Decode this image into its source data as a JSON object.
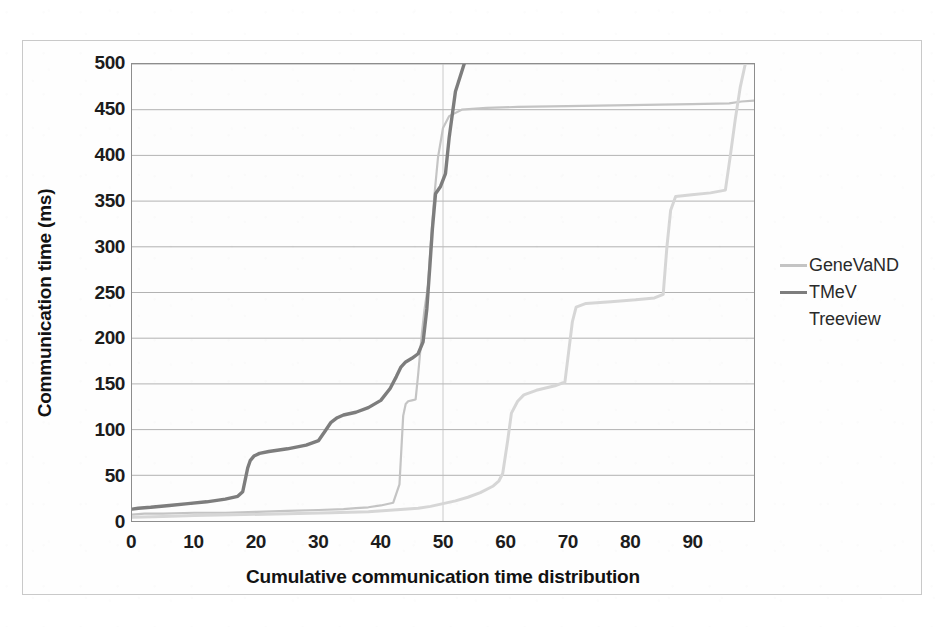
{
  "chart_data": {
    "type": "line",
    "title": "",
    "xlabel": "Cumulative communication time distribution",
    "ylabel": "Communication time (ms)",
    "xlim": [
      0,
      100
    ],
    "ylim": [
      0,
      500
    ],
    "xticks": [
      "0",
      "10",
      "20",
      "30",
      "40",
      "50",
      "60",
      "70",
      "80",
      "90"
    ],
    "xtick_values": [
      0,
      10,
      20,
      30,
      40,
      50,
      60,
      70,
      80,
      90
    ],
    "yticks": [
      "0",
      "50",
      "100",
      "150",
      "200",
      "250",
      "300",
      "350",
      "400",
      "450",
      "500"
    ],
    "ytick_values": [
      0,
      50,
      100,
      150,
      200,
      250,
      300,
      350,
      400,
      450,
      500
    ],
    "grid": true,
    "grid_axis": "y",
    "legend_position": "right",
    "series": [
      {
        "name": "GeneVaND",
        "color": "#c4c4c4",
        "width": 2.2,
        "points": [
          [
            0,
            7
          ],
          [
            2,
            8
          ],
          [
            5,
            8
          ],
          [
            10,
            9
          ],
          [
            15,
            9
          ],
          [
            20,
            10
          ],
          [
            25,
            11
          ],
          [
            30,
            12
          ],
          [
            34,
            13
          ],
          [
            36,
            14
          ],
          [
            38,
            15
          ],
          [
            40,
            17
          ],
          [
            42,
            20
          ],
          [
            43,
            40
          ],
          [
            43.6,
            115
          ],
          [
            44,
            128
          ],
          [
            44.4,
            131
          ],
          [
            45,
            132
          ],
          [
            45.6,
            133
          ],
          [
            46,
            160
          ],
          [
            46.6,
            205
          ],
          [
            47,
            230
          ],
          [
            47.6,
            258
          ],
          [
            48,
            300
          ],
          [
            48.6,
            355
          ],
          [
            49.2,
            398
          ],
          [
            50,
            430
          ],
          [
            51,
            443
          ],
          [
            53,
            450
          ],
          [
            57,
            452
          ],
          [
            62,
            453
          ],
          [
            70,
            454
          ],
          [
            80,
            455
          ],
          [
            90,
            456
          ],
          [
            96,
            457
          ],
          [
            98,
            459
          ],
          [
            100,
            460
          ]
        ]
      },
      {
        "name": "TMeV",
        "color": "#7d7d7d",
        "width": 3.4,
        "points": [
          [
            0,
            13
          ],
          [
            1,
            14
          ],
          [
            3,
            15
          ],
          [
            6,
            17
          ],
          [
            9,
            19
          ],
          [
            12,
            21
          ],
          [
            15,
            24
          ],
          [
            17,
            27
          ],
          [
            17.8,
            32
          ],
          [
            18.2,
            45
          ],
          [
            18.6,
            58
          ],
          [
            19,
            66
          ],
          [
            19.6,
            71
          ],
          [
            20.5,
            74
          ],
          [
            22,
            76
          ],
          [
            25,
            79
          ],
          [
            28,
            83
          ],
          [
            30,
            88
          ],
          [
            31,
            98
          ],
          [
            32,
            108
          ],
          [
            33,
            113
          ],
          [
            34,
            116
          ],
          [
            36,
            119
          ],
          [
            38,
            124
          ],
          [
            40,
            132
          ],
          [
            41.5,
            145
          ],
          [
            42.5,
            158
          ],
          [
            43.2,
            168
          ],
          [
            44,
            174
          ],
          [
            45,
            178
          ],
          [
            46,
            183
          ],
          [
            46.8,
            196
          ],
          [
            47.4,
            232
          ],
          [
            47.9,
            280
          ],
          [
            48.3,
            320
          ],
          [
            48.8,
            358
          ],
          [
            49.6,
            366
          ],
          [
            50.4,
            380
          ],
          [
            51,
            420
          ],
          [
            52,
            470
          ],
          [
            53.4,
            500
          ]
        ]
      },
      {
        "name": "Treeview",
        "color": "#d6d6d6",
        "width": 3.0,
        "points": [
          [
            0,
            4
          ],
          [
            5,
            5
          ],
          [
            10,
            6
          ],
          [
            18,
            7
          ],
          [
            25,
            8
          ],
          [
            32,
            9
          ],
          [
            38,
            10
          ],
          [
            42,
            12
          ],
          [
            46,
            14
          ],
          [
            48,
            16
          ],
          [
            50,
            19
          ],
          [
            52,
            22
          ],
          [
            54,
            26
          ],
          [
            56,
            31
          ],
          [
            58,
            38
          ],
          [
            59,
            44
          ],
          [
            59.6,
            52
          ],
          [
            60.4,
            88
          ],
          [
            61,
            118
          ],
          [
            62,
            131
          ],
          [
            63,
            138
          ],
          [
            65,
            143
          ],
          [
            68,
            148
          ],
          [
            69.6,
            152
          ],
          [
            70.2,
            185
          ],
          [
            70.8,
            218
          ],
          [
            71.4,
            234
          ],
          [
            73,
            238
          ],
          [
            77,
            240
          ],
          [
            81,
            242
          ],
          [
            84,
            244
          ],
          [
            85.4,
            248
          ],
          [
            86,
            300
          ],
          [
            86.6,
            340
          ],
          [
            87.4,
            355
          ],
          [
            90,
            357
          ],
          [
            93,
            359
          ],
          [
            95.4,
            362
          ],
          [
            96.2,
            400
          ],
          [
            97,
            440
          ],
          [
            97.8,
            475
          ],
          [
            98.6,
            500
          ]
        ]
      }
    ]
  },
  "legend": {
    "items": [
      {
        "label": "GeneVaND",
        "color": "#c4c4c4",
        "swatch": "line"
      },
      {
        "label": "TMeV",
        "color": "#7d7d7d",
        "swatch": "line"
      },
      {
        "label": "Treeview",
        "color": "#dcdcdc",
        "swatch": "line"
      }
    ]
  },
  "axes": {
    "y_title": "Communication time (ms)",
    "x_title": "Cumulative communication time distribution"
  }
}
